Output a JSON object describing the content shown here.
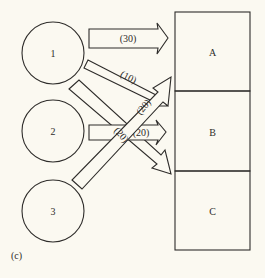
{
  "caption": "(c)",
  "colors": {
    "background": "#fbf9f1",
    "ink": "#2e2c2a"
  },
  "sources": [
    {
      "id": "1",
      "label": "1"
    },
    {
      "id": "2",
      "label": "2"
    },
    {
      "id": "3",
      "label": "3"
    }
  ],
  "destinations": [
    {
      "id": "A",
      "label": "A"
    },
    {
      "id": "B",
      "label": "B"
    },
    {
      "id": "C",
      "label": "C"
    }
  ],
  "flows": [
    {
      "from": "1",
      "to": "A",
      "label": "(30)"
    },
    {
      "from": "1",
      "to": "B",
      "label": "(10)"
    },
    {
      "from": "1",
      "to": "C",
      "label": "(20)"
    },
    {
      "from": "2",
      "to": "B",
      "label": "(20)"
    },
    {
      "from": "3",
      "to": "A",
      "label": "(20)"
    }
  ]
}
